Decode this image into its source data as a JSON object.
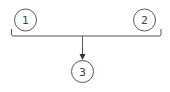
{
  "diagram": {
    "type": "merge-flow",
    "nodes": [
      {
        "id": "node-1",
        "label": "1",
        "cx": 25.5,
        "cy": 20,
        "r": 11
      },
      {
        "id": "node-2",
        "label": "2",
        "cx": 144.5,
        "cy": 20,
        "r": 11
      },
      {
        "id": "node-3",
        "label": "3",
        "cx": 82.5,
        "cy": 71.5,
        "r": 11
      }
    ],
    "edges": [
      {
        "from": [
          "node-1",
          "node-2"
        ],
        "to": "node-3",
        "style": "bracket-merge-arrow"
      }
    ],
    "colors": {
      "stroke": "#555555",
      "text": "#444444",
      "background": "#ffffff"
    }
  }
}
